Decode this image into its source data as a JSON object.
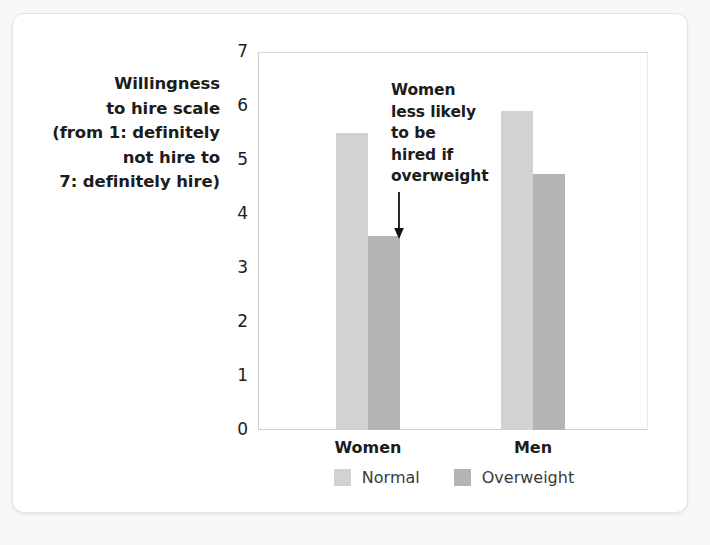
{
  "figure": {
    "y_axis_caption_lines": [
      "Willingness",
      "to hire scale",
      "(from 1: definitely",
      "not hire to",
      "7: definitely hire)"
    ],
    "annotation_lines": [
      "Women",
      "less likely",
      "to be",
      "hired if",
      "overweight"
    ],
    "annotation_icon": "down-arrow-icon",
    "colors": {
      "normal_bar": "#d2d2d2",
      "overweight_bar": "#b4b4b4",
      "gridline": "#e0e0e0",
      "axis": "#cfcfcf",
      "text": "#1c1c1c",
      "card_background": "#ffffff",
      "page_background": "#f7f7f7"
    }
  },
  "chart_data": {
    "type": "bar",
    "title": "",
    "xlabel": "",
    "ylabel": "Willingness to hire scale (from 1: definitely not hire to 7: definitely hire)",
    "categories": [
      "Women",
      "Men"
    ],
    "series": [
      {
        "name": "Normal",
        "values": [
          5.5,
          5.9
        ]
      },
      {
        "name": "Overweight",
        "values": [
          3.6,
          4.75
        ]
      }
    ],
    "ylim": [
      0,
      7
    ],
    "yticks": [
      0,
      1,
      2,
      3,
      4,
      5,
      6,
      7
    ],
    "ytick_labels": [
      "0",
      "1",
      "2",
      "3",
      "4",
      "5",
      "6",
      "7"
    ],
    "grid": true,
    "legend_position": "bottom",
    "annotations": [
      {
        "text": "Women less likely to be hired if overweight",
        "points_to": {
          "category": "Women",
          "series": "Overweight"
        }
      }
    ]
  }
}
